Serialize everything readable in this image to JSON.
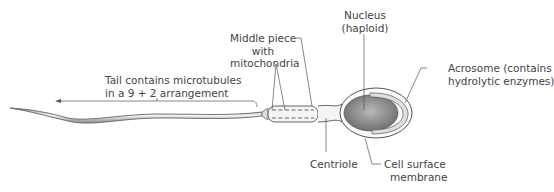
{
  "diagram": {
    "labels": {
      "tail": {
        "line1": "Tail contains microtubules",
        "line2": "in a 9 + 2 arrangement"
      },
      "middle_piece": {
        "line1": "Middle piece",
        "line2": "with",
        "line3": "mitochondria"
      },
      "nucleus": {
        "line1": "Nucleus",
        "line2": "(haploid)"
      },
      "acrosome": {
        "line1": "Acrosome (contains",
        "line2": "hydrolytic enzymes)"
      },
      "centriole": {
        "line1": "Centriole"
      },
      "cell_membrane": {
        "line1": "Cell surface",
        "line2": "membrane"
      }
    },
    "colors": {
      "line": "#555555",
      "text": "#444444",
      "nucleus_dark": "#6f6f6f",
      "nucleus_light": "#b5b5b5",
      "acrosome_fill": "#dedede"
    }
  }
}
